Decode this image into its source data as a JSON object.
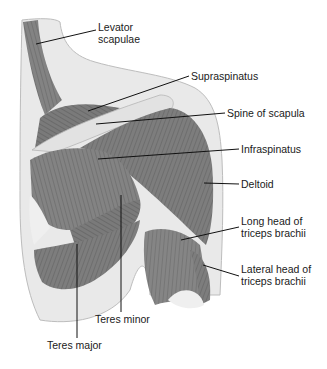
{
  "figure": {
    "background": "#ffffff",
    "muscle_color": "#7a7a7a",
    "skin_color": "#e6e6e6"
  },
  "labels": [
    {
      "id": "levator",
      "lines": [
        "Levator",
        "scapulae"
      ],
      "x": 98,
      "y": 21,
      "pt": [
        36,
        44
      ]
    },
    {
      "id": "supraspinatus",
      "lines": [
        "Supraspinatus"
      ],
      "x": 191,
      "y": 70,
      "pt": [
        88,
        111
      ]
    },
    {
      "id": "spine",
      "lines": [
        "Spine of scapula"
      ],
      "x": 227,
      "y": 108,
      "pt": [
        96,
        124
      ]
    },
    {
      "id": "infraspinatus",
      "lines": [
        "Infraspinatus"
      ],
      "x": 241,
      "y": 143,
      "pt": [
        98,
        159
      ]
    },
    {
      "id": "deltoid",
      "lines": [
        "Deltoid"
      ],
      "x": 241,
      "y": 179,
      "pt": [
        204,
        183
      ]
    },
    {
      "id": "long_head",
      "lines": [
        "Long head of",
        "triceps brachii"
      ],
      "x": 241,
      "y": 216,
      "pt": [
        181,
        240
      ]
    },
    {
      "id": "lateral_head",
      "lines": [
        "Lateral head of",
        "triceps brachii"
      ],
      "x": 241,
      "y": 264,
      "pt": [
        203,
        265
      ]
    },
    {
      "id": "teres_minor",
      "lines": [
        "Teres minor"
      ],
      "x": 95,
      "y": 314,
      "pt": [
        121,
        195
      ]
    },
    {
      "id": "teres_major",
      "lines": [
        "Teres major"
      ],
      "x": 47,
      "y": 340,
      "pt": [
        77,
        244
      ]
    }
  ]
}
